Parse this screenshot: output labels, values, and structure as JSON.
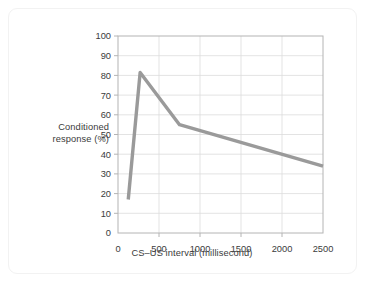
{
  "figure": {
    "background_color": "#ffffff",
    "card_border_color": "#f2f2f2"
  },
  "chart_data": {
    "type": "line",
    "title": "",
    "xlabel": "CS–US interval (millisecond)",
    "ylabel": "Conditioned response (%)",
    "ylabel_line1": "Conditioned",
    "ylabel_line2": "response (%)",
    "xlim": [
      0,
      2500
    ],
    "ylim": [
      0,
      100
    ],
    "grid": true,
    "legend": "none",
    "line_color": "#9a9a9a",
    "line_width": 3.4,
    "xticks": [
      0,
      500,
      1000,
      1500,
      2000,
      2500
    ],
    "xtick_labels": [
      "0",
      "500",
      "1000",
      "1500",
      "2000",
      "2500"
    ],
    "yticks": [
      0,
      10,
      20,
      30,
      40,
      50,
      60,
      70,
      80,
      90,
      100
    ],
    "ytick_labels": [
      "0",
      "10",
      "20",
      "30",
      "40",
      "50",
      "60",
      "70",
      "80",
      "90",
      "100"
    ],
    "x": [
      125,
      270,
      750,
      2500
    ],
    "values": [
      17,
      81.5,
      55,
      34
    ],
    "series": [
      {
        "name": "Conditioned response",
        "points": [
          {
            "x": 125,
            "y": 17
          },
          {
            "x": 270,
            "y": 81.5
          },
          {
            "x": 750,
            "y": 55
          },
          {
            "x": 2500,
            "y": 34
          }
        ]
      }
    ]
  }
}
